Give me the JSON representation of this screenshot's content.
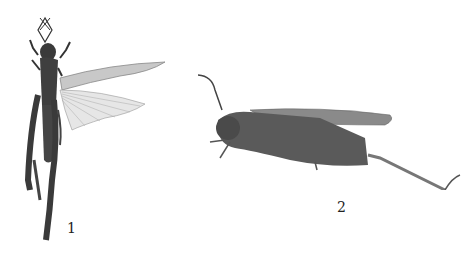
{
  "figure": {
    "specimens": [
      {
        "label": "1",
        "view": "dorsal",
        "subject": "grasshopper with wings spread"
      },
      {
        "label": "2",
        "view": "lateral",
        "subject": "grasshopper side view"
      }
    ],
    "colors": {
      "body": "#3a3a3a",
      "wing": "#9a9a9a",
      "background": "#ffffff"
    }
  }
}
